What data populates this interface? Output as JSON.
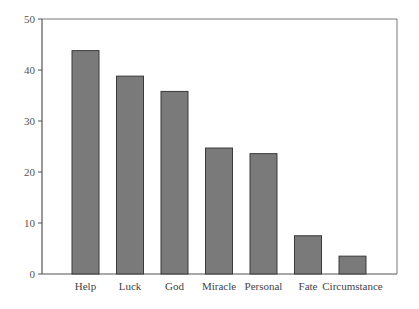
{
  "chart_data": {
    "type": "bar",
    "title": "",
    "xlabel": "",
    "ylabel": "",
    "categories": [
      "Help",
      "Luck",
      "God",
      "Miracle",
      "Personal",
      "Fate",
      "Circumstance"
    ],
    "values": [
      43.8,
      38.8,
      35.8,
      24.7,
      23.6,
      7.5,
      3.5
    ],
    "ylim": [
      0,
      50
    ],
    "yticks": [
      0,
      10,
      20,
      30,
      40,
      50
    ],
    "grid": false,
    "legend": null,
    "bar_color": "#7a7a7a",
    "bar_edge_color": "#3a3a3a",
    "axis_color": "#555555"
  }
}
